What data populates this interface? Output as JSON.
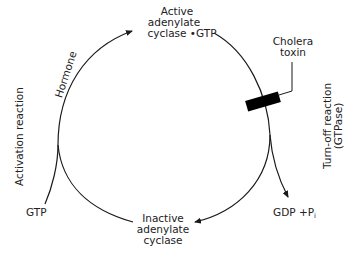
{
  "diagram": {
    "nodes": {
      "active": {
        "line1": "Active",
        "line2": "adenylate",
        "line3": "cyclase •GTP"
      },
      "inactive": {
        "line1": "Inactive",
        "line2": "adenylate",
        "line3": "cyclase"
      },
      "gtp": {
        "label": "GTP"
      },
      "gdp_pi": {
        "label": "GDP +P",
        "subscript": "i"
      },
      "toxin": {
        "line1": "Cholera",
        "line2": "toxin"
      }
    },
    "edge_labels": {
      "hormone": "Hormone"
    },
    "side_labels": {
      "left": "Activation reaction",
      "right_line1": "Turn-off reaction",
      "right_line2": "(GTPase)"
    },
    "colors": {
      "line": "#1a1a1a",
      "toxin_block": "#000000",
      "text": "#222222",
      "background": "#ffffff"
    }
  }
}
